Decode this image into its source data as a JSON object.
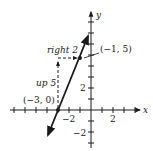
{
  "figure": {
    "type": "coordinate-plane-line",
    "axes": {
      "x_label": "x",
      "y_label": "y",
      "x_tick_labels": [
        "−2",
        "2"
      ],
      "y_tick_labels": [
        "2",
        "−2"
      ]
    },
    "line": {
      "description": "line through (-3, 0) and (-1, 5)",
      "slope": "5/2"
    },
    "points": [
      {
        "label": "(−3, 0)",
        "x": -3,
        "y": 0
      },
      {
        "label": "(−1, 5)",
        "x": -1,
        "y": 5
      }
    ],
    "annotations": {
      "rise": "up 5",
      "run": "right 2"
    },
    "colors": {
      "ink": "#1a1a1a",
      "background": "#ffffff"
    }
  }
}
